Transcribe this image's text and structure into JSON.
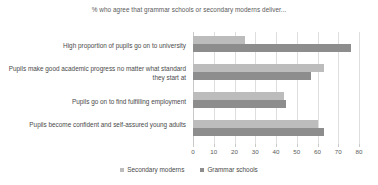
{
  "chart_data": {
    "type": "bar",
    "orientation": "horizontal",
    "title": "% who agree that grammar schools or secondary moderns deliver...",
    "xlabel": "",
    "ylabel": "",
    "xlim": [
      0,
      80
    ],
    "xticks": [
      0,
      10,
      20,
      30,
      40,
      50,
      60,
      70,
      80
    ],
    "grid": true,
    "legend_position": "bottom",
    "categories": [
      "High proportion of pupils go on to university",
      "Pupils make good academic progress no matter what standard they start at",
      "Pupils go on to find fulfilling employment",
      "Pupils become confident and self-assured young adults"
    ],
    "series": [
      {
        "name": "Secondary moderns",
        "color": "#bcbcbc",
        "values": [
          25,
          63,
          44,
          60
        ]
      },
      {
        "name": "Grammar schools",
        "color": "#8d8d8d",
        "values": [
          76,
          57,
          45,
          63
        ]
      }
    ]
  },
  "legend": {
    "items": [
      {
        "label": "Secondary moderns",
        "color": "#bcbcbc"
      },
      {
        "label": "Grammar schools",
        "color": "#8d8d8d"
      }
    ]
  }
}
